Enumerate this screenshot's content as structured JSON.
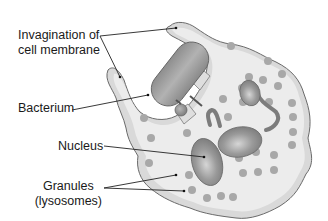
{
  "labels": {
    "invagination_line1": "Invagination of",
    "invagination_line2": "cell membrane",
    "bacterium": "Bacterium",
    "nucleus": "Nucleus",
    "granules_line1": "Granules",
    "granules_line2": "(lysosomes)"
  },
  "colors": {
    "cytoplasm": "#ececec",
    "cytoplasm_rim": "#d8d8d8",
    "outline": "#6a6a6a",
    "granule": "#a8a8a8",
    "nucleus": "#8c8c8c",
    "bacterium": "#9a9a9a",
    "leader_line": "#222222",
    "text": "#1a1a1a"
  }
}
